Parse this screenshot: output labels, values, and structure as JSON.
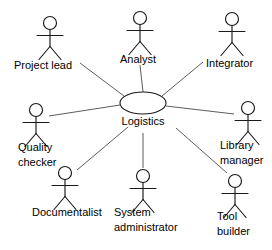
{
  "diagram": {
    "kind": "uml-use-case-diagram",
    "width": 272,
    "height": 250,
    "background_color": "#ffffff",
    "line_color": "#4a4a4a",
    "stroke_color": "#1a1a1a",
    "text_color": "#000000"
  },
  "use_case": {
    "label": "Logistics",
    "cx": 143,
    "cy": 103,
    "rx": 23,
    "ry": 11,
    "label_x": 143,
    "label_y": 122
  },
  "actors": [
    {
      "id": "project-lead",
      "label_line1": "Project lead",
      "label_line2": "",
      "head_cx": 50,
      "head_cy": 23,
      "label_x": 14,
      "label_y": 66,
      "line_from_x": 80,
      "line_from_y": 63,
      "line_to_x": 124,
      "line_to_y": 96
    },
    {
      "id": "analyst",
      "label_line1": "Analyst",
      "label_line2": "",
      "head_cx": 140,
      "head_cy": 18,
      "label_x": 120,
      "label_y": 60,
      "line_from_x": 140,
      "line_from_y": 65,
      "line_to_x": 143,
      "line_to_y": 92
    },
    {
      "id": "integrator",
      "label_line1": "Integrator",
      "label_line2": "",
      "head_cx": 232,
      "head_cy": 19,
      "label_x": 206,
      "label_y": 64,
      "line_from_x": 203,
      "line_from_y": 62,
      "line_to_x": 162,
      "line_to_y": 96
    },
    {
      "id": "quality-checker",
      "label_line1": "Quality",
      "label_line2": "checker",
      "head_cx": 36,
      "head_cy": 110,
      "label_x": 18,
      "label_y": 148,
      "line_from_x": 49,
      "line_from_y": 116,
      "line_to_x": 120,
      "line_to_y": 105
    },
    {
      "id": "library-manager",
      "label_line1": "Library",
      "label_line2": "manager",
      "head_cx": 248,
      "head_cy": 108,
      "label_x": 220,
      "label_y": 146,
      "line_from_x": 234,
      "line_from_y": 114,
      "line_to_x": 166,
      "line_to_y": 106
    },
    {
      "id": "documentalist",
      "label_line1": "Documentalist",
      "label_line2": "",
      "head_cx": 65,
      "head_cy": 173,
      "label_x": 32,
      "label_y": 213,
      "line_from_x": 77,
      "line_from_y": 170,
      "line_to_x": 128,
      "line_to_y": 127
    },
    {
      "id": "system-administrator",
      "label_line1": "System",
      "label_line2": "administrator",
      "head_cx": 143,
      "head_cy": 176,
      "label_x": 114,
      "label_y": 213,
      "line_from_x": 143,
      "line_from_y": 168,
      "line_to_x": 143,
      "line_to_y": 133
    },
    {
      "id": "tool-builder",
      "label_line1": "Tool",
      "label_line2": "builder",
      "head_cx": 235,
      "head_cy": 181,
      "label_x": 217,
      "label_y": 217,
      "line_from_x": 227,
      "line_from_y": 173,
      "line_to_x": 176,
      "line_to_y": 128
    }
  ]
}
